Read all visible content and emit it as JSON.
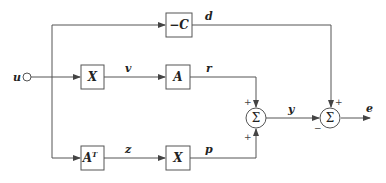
{
  "input": {
    "label": "u"
  },
  "output": {
    "label": "e"
  },
  "blocks": {
    "neg_c": {
      "label": "−C"
    },
    "x_top": {
      "label": "X"
    },
    "a": {
      "label": "A"
    },
    "a_t": {
      "label": "A",
      "sup": "T"
    },
    "x_bottom": {
      "label": "X"
    }
  },
  "signals": {
    "d": "d",
    "v": "v",
    "r": "r",
    "z": "z",
    "p": "p",
    "y": "y"
  },
  "summers": {
    "sum1": {
      "symbol": "Σ",
      "sign_top": "+",
      "sign_bottom": "+"
    },
    "sum2": {
      "symbol": "Σ",
      "sign_top": "+",
      "sign_left": "−"
    }
  },
  "colors": {
    "line": "#555555",
    "text": "#222222"
  }
}
